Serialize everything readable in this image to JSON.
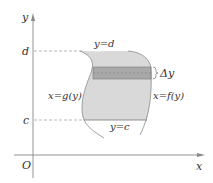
{
  "diagram": {
    "axes": {
      "x_label": "x",
      "y_label": "y",
      "origin_label": "O"
    },
    "levels": {
      "d_label": "d",
      "c_label": "c"
    },
    "curves": {
      "top_label": "y=d",
      "bottom_label": "y=c",
      "left_label": "x=g(y)",
      "right_label": "x=f(y)"
    },
    "strip": {
      "label": "Δy"
    },
    "colors": {
      "region_fill": "#d9d9d9",
      "strip_fill": "#a8a8a8",
      "axis": "#888888",
      "dashed": "#999999",
      "curve": "#8a8a8a"
    }
  }
}
